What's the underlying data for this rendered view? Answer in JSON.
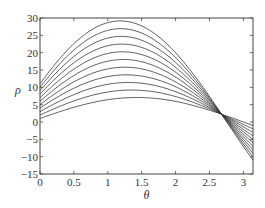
{
  "chart_data": {
    "type": "line",
    "title": "",
    "xlabel": "θ",
    "ylabel": "ρ",
    "xlim": [
      0,
      3.1416
    ],
    "ylim": [
      -15,
      30
    ],
    "xticks": [
      0,
      0.5,
      1,
      1.5,
      2,
      2.5,
      3
    ],
    "xtick_labels": [
      "0",
      "0.5",
      "1",
      "1.5",
      "2",
      "2.5",
      "3"
    ],
    "yticks": [
      -15,
      -10,
      -5,
      0,
      5,
      10,
      15,
      20,
      25,
      30
    ],
    "ytick_labels": [
      "−15",
      "−10",
      "−5",
      "0",
      "5",
      "10",
      "15",
      "20",
      "25",
      "30"
    ],
    "grid": false,
    "legend": null,
    "series_params": [
      {
        "name": "curve-1",
        "a": 1,
        "b": 7
      },
      {
        "name": "curve-2",
        "a": 2,
        "b": 9
      },
      {
        "name": "curve-3",
        "a": 3,
        "b": 11
      },
      {
        "name": "curve-4",
        "a": 4,
        "b": 13
      },
      {
        "name": "curve-5",
        "a": 5,
        "b": 15
      },
      {
        "name": "curve-6",
        "a": 6,
        "b": 17
      },
      {
        "name": "curve-7",
        "a": 7,
        "b": 19
      },
      {
        "name": "curve-8",
        "a": 8,
        "b": 21
      },
      {
        "name": "curve-9",
        "a": 9,
        "b": 23
      },
      {
        "name": "curve-10",
        "a": 10,
        "b": 25
      },
      {
        "name": "curve-11",
        "a": 11,
        "b": 27
      }
    ],
    "series_summary": {
      "start_values_at_theta_0": [
        1,
        2,
        3,
        4,
        5,
        6,
        7,
        8,
        9,
        10,
        11
      ],
      "peak_values": [
        7.07,
        9.22,
        11.4,
        13.6,
        15.81,
        18.03,
        20.25,
        22.47,
        24.7,
        26.93,
        29.15
      ],
      "end_values_at_theta_pi": [
        -1,
        -2,
        -3,
        -4,
        -5,
        -6,
        -7,
        -8,
        -9,
        -10,
        -11
      ],
      "intersection": {
        "theta": 2.678,
        "rho": 2.24
      }
    },
    "line_color": "#333333"
  },
  "layout": {
    "plot_left": 40,
    "plot_right": 253,
    "plot_top": 18,
    "plot_bottom": 174
  }
}
